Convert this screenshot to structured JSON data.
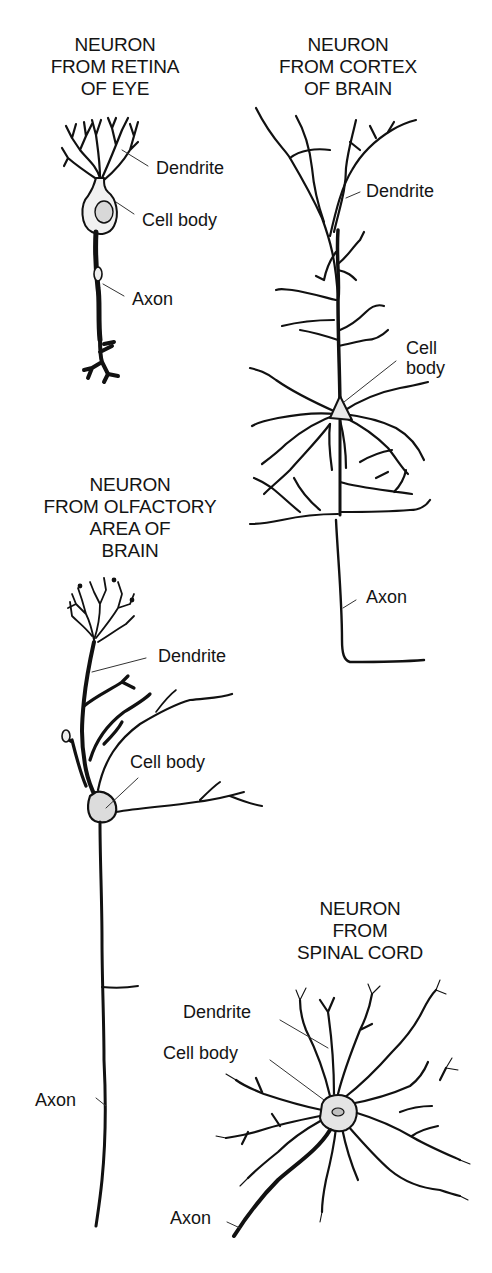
{
  "diagram": {
    "panels": [
      {
        "id": "retina",
        "title_lines": [
          "NEURON",
          "FROM RETINA",
          "OF EYE"
        ],
        "labels": {
          "dendrite": "Dendrite",
          "cell_body": "Cell body",
          "axon": "Axon"
        }
      },
      {
        "id": "cortex",
        "title_lines": [
          "NEURON",
          "FROM CORTEX",
          "OF BRAIN"
        ],
        "labels": {
          "dendrite": "Dendrite",
          "cell_body_lines": [
            "Cell",
            "body"
          ],
          "axon": "Axon"
        }
      },
      {
        "id": "olfactory",
        "title_lines": [
          "NEURON",
          "FROM OLFACTORY",
          "AREA OF",
          "BRAIN"
        ],
        "labels": {
          "dendrite": "Dendrite",
          "cell_body": "Cell body",
          "axon": "Axon"
        }
      },
      {
        "id": "spinal",
        "title_lines": [
          "NEURON",
          "FROM",
          "SPINAL CORD"
        ],
        "labels": {
          "dendrite": "Dendrite",
          "cell_body": "Cell body",
          "axon": "Axon"
        }
      }
    ],
    "colors": {
      "ink": "#111111",
      "leader_line": "#333333",
      "soma_fill": "#e6e6e6",
      "background": "#ffffff"
    }
  }
}
